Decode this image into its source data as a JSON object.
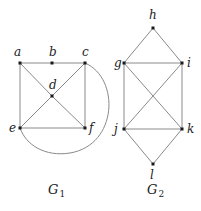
{
  "graphs": [
    {
      "name": "G",
      "subscript": "1",
      "label_pos": [
        48,
        194
      ],
      "vertices": [
        {
          "id": "a",
          "x": 20,
          "y": 63,
          "lx": 14,
          "ly": 56
        },
        {
          "id": "b",
          "x": 52,
          "y": 63,
          "lx": 49,
          "ly": 56
        },
        {
          "id": "c",
          "x": 85,
          "y": 63,
          "lx": 82,
          "ly": 56
        },
        {
          "id": "d",
          "x": 52,
          "y": 96,
          "lx": 49,
          "ly": 89
        },
        {
          "id": "e",
          "x": 20,
          "y": 128,
          "lx": 9,
          "ly": 132
        },
        {
          "id": "f",
          "x": 85,
          "y": 128,
          "lx": 89,
          "ly": 132
        }
      ],
      "edges": [
        [
          "a",
          "b"
        ],
        [
          "b",
          "c"
        ],
        [
          "a",
          "e"
        ],
        [
          "c",
          "f"
        ],
        [
          "e",
          "f"
        ],
        [
          "a",
          "d"
        ],
        [
          "d",
          "f"
        ],
        [
          "c",
          "d"
        ],
        [
          "d",
          "e"
        ]
      ],
      "curved_edges": [
        {
          "from": "c",
          "to": "e",
          "path": "M85,63 C120,78 118,145 70,153 C45,157 26,145 20,128"
        }
      ]
    },
    {
      "name": "G",
      "subscript": "2",
      "label_pos": [
        147,
        194
      ],
      "vertices": [
        {
          "id": "h",
          "x": 153,
          "y": 28,
          "lx": 149,
          "ly": 19
        },
        {
          "id": "g",
          "x": 124,
          "y": 63,
          "lx": 114,
          "ly": 67
        },
        {
          "id": "i",
          "x": 182,
          "y": 63,
          "lx": 187,
          "ly": 67
        },
        {
          "id": "j",
          "x": 124,
          "y": 129,
          "lx": 114,
          "ly": 133
        },
        {
          "id": "k",
          "x": 182,
          "y": 129,
          "lx": 187,
          "ly": 133
        },
        {
          "id": "l",
          "x": 153,
          "y": 164,
          "lx": 150,
          "ly": 179
        }
      ],
      "edges": [
        [
          "h",
          "g"
        ],
        [
          "h",
          "i"
        ],
        [
          "g",
          "i"
        ],
        [
          "g",
          "j"
        ],
        [
          "i",
          "k"
        ],
        [
          "j",
          "k"
        ],
        [
          "g",
          "k"
        ],
        [
          "i",
          "j"
        ],
        [
          "j",
          "l"
        ],
        [
          "k",
          "l"
        ]
      ],
      "curved_edges": []
    }
  ]
}
